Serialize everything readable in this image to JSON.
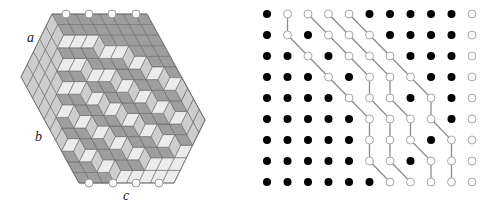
{
  "figure": {
    "left_panel": {
      "title": "lozenge tiling / plane partition in a hexagon",
      "side_labels": [
        {
          "text": "a",
          "x": 27,
          "y": 42
        },
        {
          "text": "b",
          "x": 35,
          "y": 141
        },
        {
          "text": "c",
          "x": 123,
          "y": 200
        }
      ],
      "hexagon": {
        "origin": [
          52,
          14
        ],
        "vec_H": [
          11.875,
          0
        ],
        "vec_R": [
          5.8,
          10.6
        ],
        "vec_L": [
          -6.2,
          12.6
        ],
        "sides": {
          "H": 8,
          "R": 10,
          "L": 5
        }
      },
      "colors": {
        "dark": "#9e9e9e",
        "mid": "#cdcdcd",
        "light": "#ececec",
        "edge": "#6b6b6b",
        "thick": "#444444"
      },
      "heights": [
        [
          5,
          5,
          5,
          4,
          4,
          3,
          2,
          1,
          0,
          0
        ],
        [
          5,
          5,
          4,
          4,
          3,
          3,
          2,
          1,
          0,
          0
        ],
        [
          5,
          4,
          4,
          3,
          3,
          2,
          1,
          1,
          0,
          0
        ],
        [
          4,
          4,
          3,
          3,
          2,
          2,
          1,
          0,
          0,
          0
        ],
        [
          4,
          3,
          3,
          2,
          2,
          1,
          1,
          0,
          0,
          0
        ],
        [
          3,
          3,
          2,
          2,
          1,
          1,
          0,
          0,
          0,
          0
        ],
        [
          3,
          2,
          2,
          1,
          1,
          0,
          0,
          0,
          0,
          0
        ],
        [
          2,
          2,
          1,
          1,
          0,
          0,
          0,
          0,
          0,
          0
        ]
      ],
      "top_markers_x": [
        66,
        89,
        112,
        136
      ],
      "top_markers_y": 14,
      "bottom_markers_x": [
        89,
        113,
        136,
        159
      ],
      "bottom_markers_y": 183
    },
    "right_panel": {
      "title": "non-intersecting lattice paths",
      "grid_origin": [
        267,
        14
      ],
      "col_step": 20.5,
      "row_step": 21,
      "grid": [
        "FOOOOFFFFFO",
        "FOFOOOFFFFO",
        "FFOFOOOFFFO",
        "FFFOFOOOFFO",
        "FFFFOOOFOFO",
        "FFFFFOOOOFO",
        "FFFFFOOOFOO",
        "FFFFFOOFOOO",
        "FFFFFFOOOOO"
      ],
      "paths": [
        [
          [
            0,
            1
          ],
          [
            1,
            1
          ],
          [
            2,
            2
          ],
          [
            3,
            3
          ],
          [
            4,
            4
          ],
          [
            5,
            5
          ],
          [
            6,
            5
          ],
          [
            7,
            5
          ],
          [
            8,
            6
          ]
        ],
        [
          [
            0,
            2
          ],
          [
            1,
            3
          ],
          [
            2,
            4
          ],
          [
            3,
            5
          ],
          [
            4,
            5
          ],
          [
            5,
            6
          ],
          [
            6,
            6
          ],
          [
            7,
            6
          ],
          [
            8,
            7
          ]
        ],
        [
          [
            0,
            3
          ],
          [
            1,
            4
          ],
          [
            2,
            5
          ],
          [
            3,
            6
          ],
          [
            4,
            6
          ],
          [
            5,
            7
          ],
          [
            6,
            7
          ],
          [
            7,
            8
          ],
          [
            8,
            8
          ]
        ],
        [
          [
            0,
            4
          ],
          [
            1,
            5
          ],
          [
            2,
            6
          ],
          [
            3,
            7
          ],
          [
            4,
            8
          ],
          [
            5,
            8
          ],
          [
            6,
            9
          ],
          [
            7,
            9
          ],
          [
            8,
            9
          ]
        ]
      ],
      "colors": {
        "filled": "#000000",
        "open_stroke": "#a8a8a8",
        "path": "#8c8c8c"
      }
    }
  }
}
